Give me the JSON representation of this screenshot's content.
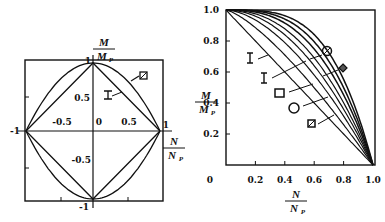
{
  "chart_data": [
    {
      "type": "line",
      "title": "",
      "xlabel": "N/N_P",
      "ylabel": "M/M_P",
      "xlim": [
        -1,
        1
      ],
      "ylim": [
        -1,
        1
      ],
      "tick_labels": {
        "x": [
          "-1",
          "-0.5",
          "0",
          "0.5",
          "1"
        ],
        "y": [
          "1",
          "0.5",
          "-0.5",
          "-1"
        ]
      },
      "axis_labels": {
        "x_num": "N",
        "x_den": "N",
        "x_den_sub": "P",
        "y_num": "M",
        "y_den": "M",
        "y_den_sub": "P"
      },
      "series": [
        {
          "name": "I-section",
          "marker": "I",
          "shape": "diamond",
          "points": [
            [
              1,
              0
            ],
            [
              0,
              1
            ],
            [
              -1,
              0
            ],
            [
              0,
              -1
            ],
            [
              1,
              0
            ]
          ]
        },
        {
          "name": "rectangular section",
          "marker": "hatched-square",
          "shape": "parabola",
          "formula": "M = 1 - N^2",
          "points": [
            [
              -1,
              0
            ],
            [
              -0.5,
              0.75
            ],
            [
              0,
              1
            ],
            [
              0.5,
              0.75
            ],
            [
              1,
              0
            ],
            [
              0.5,
              -0.75
            ],
            [
              0,
              -1
            ],
            [
              -0.5,
              -0.75
            ],
            [
              -1,
              0
            ]
          ]
        }
      ],
      "annotations": [
        {
          "text": "I",
          "target": "I-section"
        },
        {
          "text": "hatched-square",
          "target": "rectangular section"
        }
      ]
    },
    {
      "type": "line",
      "title": "",
      "xlabel": "N/N_P",
      "ylabel": "M/M_P",
      "xlim": [
        0,
        1.0
      ],
      "ylim": [
        0,
        1.0
      ],
      "xticks": [
        0,
        0.2,
        0.4,
        0.6,
        0.8,
        1.0
      ],
      "yticks": [
        0,
        0.2,
        0.4,
        0.6,
        0.8,
        1.0
      ],
      "tick_labels": {
        "x": [
          "0",
          "0.2",
          "0.4",
          "0.6",
          "0.8",
          "1.0"
        ],
        "y": [
          "0",
          "0.2",
          "0.4",
          "0.6",
          "0.8",
          "1.0"
        ]
      },
      "axis_labels": {
        "x_num": "N",
        "x_den": "N",
        "x_den_sub": "P",
        "y_num": "M",
        "y_den": "M",
        "y_den_sub": "P"
      },
      "series": [
        {
          "name": "I (strong axis)",
          "marker": "I",
          "exponent": 1.0
        },
        {
          "name": "I (weak axis)",
          "marker": "I",
          "exponent": 1.35
        },
        {
          "name": "square box",
          "marker": "square",
          "exponent": 1.7
        },
        {
          "name": "circular tube",
          "marker": "circle",
          "exponent": 2.0
        },
        {
          "name": "rectangle",
          "marker": "hatched-square",
          "exponent": 2.3
        },
        {
          "name": "solid circle",
          "marker": "hatched-circle",
          "exponent": 2.7
        },
        {
          "name": "solid diamond",
          "marker": "hatched-diamond",
          "exponent": 3.1
        },
        {
          "name": "upper bound",
          "marker": "",
          "exponent": 3.6
        }
      ],
      "formula": "M/M_P = 1 - (N/N_P)^k",
      "sample_x": [
        0,
        0.2,
        0.4,
        0.6,
        0.8,
        1.0
      ]
    }
  ]
}
